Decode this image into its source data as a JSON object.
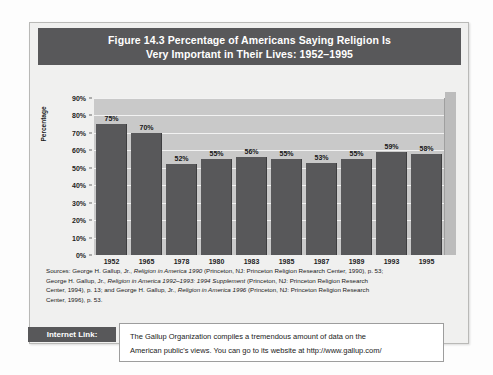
{
  "figure": {
    "title_line1": "Figure 14.3  Percentage of Americans Saying Religion Is",
    "title_line2": "Very Important in Their Lives: 1952–1995"
  },
  "chart_data": {
    "type": "bar",
    "title": "Figure 14.3  Percentage of Americans Saying Religion Is Very Important in Their Lives: 1952–1995",
    "xlabel": "",
    "ylabel": "Percentage",
    "categories": [
      "1952",
      "1965",
      "1978",
      "1980",
      "1983",
      "1985",
      "1987",
      "1989",
      "1993",
      "1995"
    ],
    "values": [
      75,
      70,
      52,
      55,
      56,
      55,
      53,
      55,
      59,
      58
    ],
    "data_labels": [
      "75%",
      "70%",
      "52%",
      "55%",
      "56%",
      "55%",
      "53%",
      "55%",
      "59%",
      "58%"
    ],
    "ylim": [
      0,
      90
    ],
    "ytick_labels": [
      "90%",
      "80%",
      "70%",
      "60%",
      "50%",
      "40%",
      "30%",
      "20%",
      "10%",
      "0%"
    ],
    "ytick_values": [
      90,
      80,
      70,
      60,
      50,
      40,
      30,
      20,
      10,
      0
    ],
    "grid": true,
    "legend": "none",
    "bar_color": "#58585a",
    "plot_background": "#c9c9c9",
    "gridline_color": "#f2f2f2"
  },
  "sources": {
    "lines": [
      "Sources: George H. Gallup, Jr., Religion in America 1990 (Princeton, NJ: Princeton Religion Research Center, 1990), p. 53;",
      "George H. Gallup, Jr., Religion in America 1992–1993: 1994 Supplement (Princeton, NJ: Princeton Religion Research",
      "Center, 1994), p. 13; and George H. Gallup, Jr., Religion in America 1996 (Princeton, NJ: Princeton Religion Research",
      "Center, 1996), p. 53."
    ]
  },
  "internet_link": {
    "label": "Internet Link:",
    "text_line1": "The Gallup Organization compiles a tremendous amount of data on the",
    "text_line2": "American public's views. You can go to its website at http://www.gallup.com/"
  },
  "colors": {
    "banner": "#58585a",
    "bar": "#58585a",
    "plot_bg": "#c9c9c9",
    "figure_bg": "#f0f0ef"
  }
}
